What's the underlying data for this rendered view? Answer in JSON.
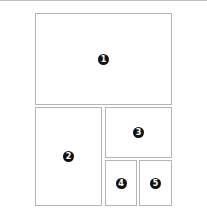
{
  "diagram": {
    "type": "layout-panels",
    "panels": [
      {
        "id": 1,
        "label": "1"
      },
      {
        "id": 2,
        "label": "2"
      },
      {
        "id": 3,
        "label": "3"
      },
      {
        "id": 4,
        "label": "4"
      },
      {
        "id": 5,
        "label": "5"
      }
    ]
  },
  "colors": {
    "border": "#b5b5b5",
    "badge": "#111111"
  }
}
